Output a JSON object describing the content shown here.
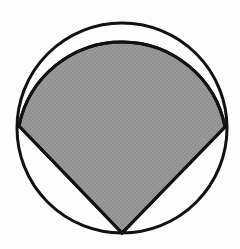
{
  "figure": {
    "canvas": {
      "width": 240,
      "height": 249,
      "background_color": "#fdfdfd"
    },
    "colors": {
      "stroke": "#111111",
      "shaded_fill": "#919191",
      "unshaded_fill": "#fdfdfd",
      "dither_light": "#9a9a9a",
      "dither_dark": "#888888"
    },
    "stroke_width": 3,
    "circle": {
      "name": "outer-circle",
      "center_x": 122,
      "center_y": 128,
      "radius": 105,
      "top_y": 23,
      "bottom_y": 234,
      "left_x": 17,
      "right_x": 227
    },
    "shaded_region": {
      "name": "shaded-region",
      "description": "Region bounded by two chords from the bottom point of the circle to the left and right points, closed above by the major arc between those points",
      "vertices": [
        {
          "label": "left-vertex",
          "x": 19,
          "y": 126
        },
        {
          "label": "right-vertex",
          "x": 225,
          "y": 127
        },
        {
          "label": "bottom-vertex",
          "x": 122,
          "y": 233
        }
      ],
      "upper_arc": {
        "label": "upper-arc",
        "start_x": 19,
        "start_y": 126,
        "end_x": 225,
        "end_y": 127,
        "apex_x": 122,
        "apex_y": 79,
        "radius": 105,
        "sweep": 1,
        "large_arc": 0
      },
      "edges": [
        {
          "label": "left-chord",
          "from": "left-vertex",
          "to": "bottom-vertex"
        },
        {
          "label": "right-chord",
          "from": "right-vertex",
          "to": "bottom-vertex"
        }
      ]
    },
    "unshaded_regions": [
      {
        "name": "top-segment",
        "description": "White circular segment above the upper arc"
      },
      {
        "name": "bottom-left-segment",
        "description": "White region left of the left chord"
      },
      {
        "name": "bottom-right-segment",
        "description": "White region right of the right chord"
      }
    ]
  }
}
